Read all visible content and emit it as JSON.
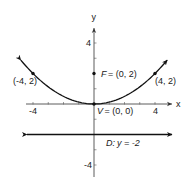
{
  "diagram": {
    "type": "parabola",
    "equation": "x^2 = 8y",
    "axes": {
      "x_label": "x",
      "y_label": "y",
      "x_range": [
        -5,
        5
      ],
      "y_range": [
        -5,
        5
      ],
      "x_tick_labels": [
        {
          "value": -4,
          "text": "-4"
        },
        {
          "value": 4,
          "text": "4"
        }
      ],
      "y_tick_labels": [
        {
          "value": 4,
          "text": "4"
        },
        {
          "value": -4,
          "text": "-4"
        }
      ],
      "x_ticks": [
        -4,
        -3,
        -2,
        -1,
        1,
        2,
        3,
        4
      ],
      "y_ticks": [
        -4,
        -3,
        -1,
        1,
        3,
        4
      ]
    },
    "points": [
      {
        "id": "focus",
        "x": 0,
        "y": 2,
        "label": "F = (0, 2)",
        "label_prefix": "F",
        "label_value": "= (0, 2)"
      },
      {
        "id": "vertex",
        "x": 0,
        "y": 0,
        "label": "V = (0, 0)",
        "label_prefix": "V",
        "label_value": "= (0, 0)"
      },
      {
        "id": "left-point",
        "x": -4,
        "y": 2,
        "label": "(-4, 2)"
      },
      {
        "id": "right-point",
        "x": 4,
        "y": 2,
        "label": "(4, 2)"
      }
    ],
    "directrix": {
      "y": -2,
      "label": "D: y = -2",
      "label_prefix": "D:",
      "label_value": "y = -2"
    },
    "curve_x_range": [
      -4.8,
      4.8
    ]
  }
}
